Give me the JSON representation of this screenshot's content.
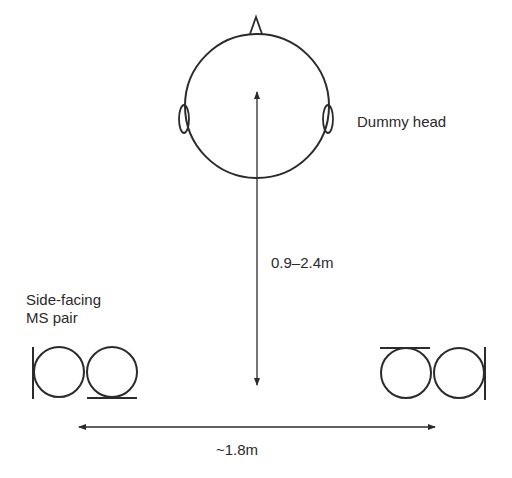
{
  "diagram": {
    "labels": {
      "dummy_head": "Dummy head",
      "distance_vertical": "0.9–2.4m",
      "distance_horizontal": "~1.8m",
      "mic_pair_line1": "Side-facing",
      "mic_pair_line2": "MS pair"
    },
    "colors": {
      "line": "#2b2b2b",
      "text": "#2a2a2a",
      "background": "#ffffff"
    }
  }
}
